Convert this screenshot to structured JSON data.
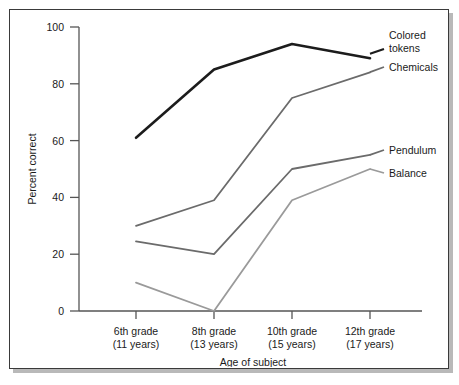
{
  "chart_data": {
    "type": "line",
    "title": "",
    "xlabel": "Age of subject",
    "ylabel": "Percent correct",
    "ylim": [
      0,
      100
    ],
    "yticks": [
      0,
      20,
      40,
      60,
      80,
      100
    ],
    "ytick_labels": [
      "0",
      "20",
      "40",
      "60",
      "80",
      "100"
    ],
    "grid": false,
    "legend_position": "right-inline-labels",
    "categories": [
      "6th grade\n(11 years)",
      "8th grade\n(13 years)",
      "10th grade\n(15 years)",
      "12th grade\n(17 years)"
    ],
    "category_lines": [
      {
        "top": "6th grade",
        "bottom": "(11 years)"
      },
      {
        "top": "8th grade",
        "bottom": "(13 years)"
      },
      {
        "top": "10th grade",
        "bottom": "(15 years)"
      },
      {
        "top": "12th grade",
        "bottom": "(17 years)"
      }
    ],
    "series": [
      {
        "name": "Colored tokens",
        "label_lines": [
          "Colored",
          "tokens"
        ],
        "color": "#1c1c1c",
        "width": 2.6,
        "values": [
          61,
          85,
          94,
          89
        ]
      },
      {
        "name": "Chemicals",
        "label_lines": [
          "Chemicals"
        ],
        "color": "#6b6b6b",
        "width": 1.8,
        "values": [
          30,
          39,
          75,
          84
        ]
      },
      {
        "name": "Pendulum",
        "label_lines": [
          "Pendulum"
        ],
        "color": "#6b6b6b",
        "width": 1.8,
        "values": [
          24.5,
          20,
          50,
          55
        ]
      },
      {
        "name": "Balance",
        "label_lines": [
          "Balance"
        ],
        "color": "#9a9a9a",
        "width": 1.8,
        "values": [
          10,
          0,
          39,
          50
        ]
      }
    ]
  },
  "labels": {
    "y_axis_title": "Percent correct",
    "x_axis_title": "Age of subject",
    "series_colored_tokens_1": "Colored",
    "series_colored_tokens_2": "tokens",
    "series_chemicals": "Chemicals",
    "series_pendulum": "Pendulum",
    "series_balance": "Balance",
    "ytick_0": "0",
    "ytick_20": "20",
    "ytick_40": "40",
    "ytick_60": "60",
    "ytick_80": "80",
    "ytick_100": "100",
    "cat_1_top": "6th grade",
    "cat_1_bottom": "(11 years)",
    "cat_2_top": "8th grade",
    "cat_2_bottom": "(13 years)",
    "cat_3_top": "10th grade",
    "cat_3_bottom": "(15 years)",
    "cat_4_top": "12th grade",
    "cat_4_bottom": "(17 years)"
  },
  "colors": {
    "frame": "#3a3a3a",
    "shadow": "#b9b9b9",
    "axis": "#555555",
    "dark_series": "#1c1c1c",
    "mid_series": "#6b6b6b",
    "light_series": "#9a9a9a",
    "text": "#1a1a1a",
    "background": "#ffffff"
  }
}
